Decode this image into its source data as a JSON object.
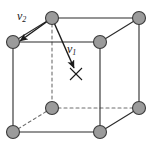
{
  "figure": {
    "name": "cubic-unit-cell-with-vectors",
    "background_color": "#ffffff",
    "width": 159,
    "height": 146
  },
  "style": {
    "atom_fill": "#9b9b9b",
    "atom_stroke": "#3b3b3b",
    "edge_color": "#2b2b2b",
    "hidden_edge_color": "#6e6e6e",
    "vector_color": "#1a1a1a",
    "atom_radius": 6.5,
    "edge_width": 1.1,
    "hidden_edge_dash": "3,3"
  },
  "labels": {
    "v2": {
      "text": "v",
      "sub": "2"
    },
    "v1": {
      "text": "v",
      "sub": "1"
    }
  },
  "atoms": [
    {
      "id": "top-back-left",
      "name": "atom-top-back-left",
      "cx": 52,
      "cy": 18,
      "hidden": false
    },
    {
      "id": "top-back-right",
      "name": "atom-top-back-right",
      "cx": 139,
      "cy": 18,
      "hidden": false
    },
    {
      "id": "top-front-left",
      "name": "atom-top-front-left",
      "cx": 13,
      "cy": 42,
      "hidden": false
    },
    {
      "id": "top-front-right",
      "name": "atom-top-front-right",
      "cx": 100,
      "cy": 42,
      "hidden": false
    },
    {
      "id": "bot-back-left",
      "name": "atom-bottom-back-left",
      "cx": 52,
      "cy": 108,
      "hidden": true
    },
    {
      "id": "bot-back-right",
      "name": "atom-bottom-back-right",
      "cx": 139,
      "cy": 108,
      "hidden": false
    },
    {
      "id": "bot-front-left",
      "name": "atom-bottom-front-left",
      "cx": 13,
      "cy": 132,
      "hidden": false
    },
    {
      "id": "bot-front-right",
      "name": "atom-bottom-front-right",
      "cx": 100,
      "cy": 132,
      "hidden": false
    }
  ],
  "edges": [
    {
      "name": "edge-top-back",
      "x1": 52,
      "y1": 18,
      "x2": 139,
      "y2": 18,
      "hidden": false
    },
    {
      "name": "edge-top-front",
      "x1": 13,
      "y1": 42,
      "x2": 100,
      "y2": 42,
      "hidden": false
    },
    {
      "name": "edge-top-left-diag",
      "x1": 13,
      "y1": 42,
      "x2": 52,
      "y2": 18,
      "hidden": false
    },
    {
      "name": "edge-top-right-diag",
      "x1": 100,
      "y1": 42,
      "x2": 139,
      "y2": 18,
      "hidden": false
    },
    {
      "name": "edge-vert-front-left",
      "x1": 13,
      "y1": 42,
      "x2": 13,
      "y2": 132,
      "hidden": false
    },
    {
      "name": "edge-vert-front-right",
      "x1": 100,
      "y1": 42,
      "x2": 100,
      "y2": 132,
      "hidden": false
    },
    {
      "name": "edge-vert-back-right",
      "x1": 139,
      "y1": 18,
      "x2": 139,
      "y2": 108,
      "hidden": false
    },
    {
      "name": "edge-vert-back-left",
      "x1": 52,
      "y1": 18,
      "x2": 52,
      "y2": 108,
      "hidden": true
    },
    {
      "name": "edge-bottom-front",
      "x1": 13,
      "y1": 132,
      "x2": 100,
      "y2": 132,
      "hidden": false
    },
    {
      "name": "edge-bottom-right-diag",
      "x1": 100,
      "y1": 132,
      "x2": 139,
      "y2": 108,
      "hidden": false
    },
    {
      "name": "edge-bottom-back",
      "x1": 52,
      "y1": 108,
      "x2": 139,
      "y2": 108,
      "hidden": true
    },
    {
      "name": "edge-bottom-left-diag",
      "x1": 13,
      "y1": 132,
      "x2": 52,
      "y2": 108,
      "hidden": true
    }
  ],
  "vectors": [
    {
      "id": "v2",
      "name": "vector-v2",
      "label": "v2",
      "x1": 52,
      "y1": 18,
      "x2": 20,
      "y2": 41,
      "label_x": 17,
      "label_y": 10
    },
    {
      "id": "v1",
      "name": "vector-v1",
      "label": "v1",
      "x1": 52,
      "y1": 18,
      "x2": 74,
      "y2": 68,
      "label_x": 67,
      "label_y": 43
    }
  ],
  "markers": [
    {
      "id": "x-mark",
      "name": "x-mark-target",
      "cx": 76,
      "cy": 74,
      "size": 6
    }
  ]
}
